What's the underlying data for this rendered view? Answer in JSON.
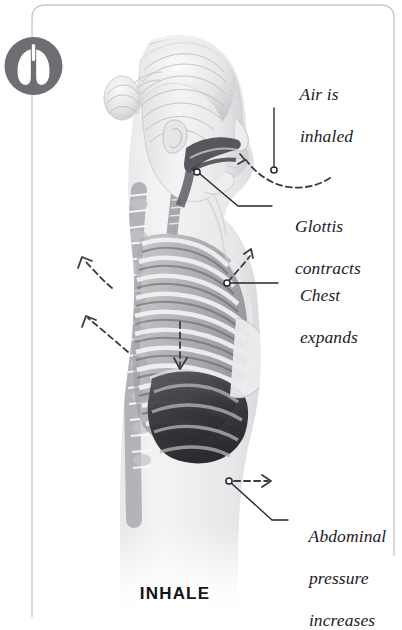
{
  "page": {
    "caption": "INHALE",
    "background_color": "#ffffff",
    "border_color": "#c9c9cd",
    "text_color": "#1b1b1f"
  },
  "badge": {
    "name": "lungs-icon",
    "shape": "circle",
    "fill_color": "#6d6d72",
    "glyph_color": "#ffffff",
    "connector_color": "#bdbdc2"
  },
  "illustration": {
    "name": "human-torso-respiration-diagram",
    "subject": "female figure in side profile, facing right, showing ribcage, lungs, diaphragm, spine and airway",
    "palette": {
      "skin_light": "#f2f2f2",
      "skin_mid": "#d8d8da",
      "bone_shadow": "#8d8d92",
      "cavity_dark": "#3c3c41",
      "lung_dark": "#2c2c31"
    }
  },
  "annotations": [
    {
      "id": "air-inhaled",
      "label": "Air is\ninhaled",
      "lines": [
        "Air is",
        "inhaled"
      ],
      "marker": {
        "x": 274,
        "y": 170
      },
      "leader": "vertical line from text down to marker on airflow arc",
      "motion": "dashed arc arrow curving from right into the nostril"
    },
    {
      "id": "glottis-contracts",
      "label": "Glottis\ncontracts",
      "lines": [
        "Glottis",
        "contracts"
      ],
      "marker": {
        "x": 197,
        "y": 172
      },
      "leader": "diagonal line from glottis up-right to text"
    },
    {
      "id": "chest-expands",
      "label": "Chest\nexpands",
      "lines": [
        "Chest",
        "expands"
      ],
      "marker": {
        "x": 227,
        "y": 283
      },
      "leader": "horizontal line from marker to text",
      "motion": "dashed arrow pointing up and out from the ribcage"
    },
    {
      "id": "abdominal-pressure",
      "label": "Abdominal\npressure\nincreases",
      "lines": [
        "Abdominal",
        "pressure",
        "increases"
      ],
      "marker": {
        "x": 229,
        "y": 481
      },
      "leader": "diagonal line from marker down-right to text",
      "motion": "dashed arrow pointing right from the abdomen"
    }
  ],
  "motion_arrows": [
    {
      "name": "back-upper-expansion-arrow",
      "direction": "up-left",
      "style": "dashed"
    },
    {
      "name": "back-lower-expansion-arrow",
      "direction": "up-left",
      "style": "dashed"
    },
    {
      "name": "chest-expansion-arrow",
      "direction": "up-right",
      "style": "dashed"
    },
    {
      "name": "diaphragm-descends-arrow",
      "direction": "down",
      "style": "dashed"
    },
    {
      "name": "abdomen-outward-arrow",
      "direction": "right",
      "style": "dashed"
    },
    {
      "name": "airflow-inhale-arrow",
      "direction": "into-nostril",
      "style": "dashed"
    }
  ]
}
